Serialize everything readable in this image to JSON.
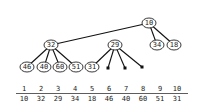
{
  "tree": {
    "nodes": [
      {
        "id": "n10",
        "label": "10",
        "x": 149,
        "y": 23
      },
      {
        "id": "n32",
        "label": "32",
        "x": 51,
        "y": 45
      },
      {
        "id": "n29",
        "label": "29",
        "x": 115,
        "y": 45
      },
      {
        "id": "n34",
        "label": "34",
        "x": 157,
        "y": 45
      },
      {
        "id": "n18",
        "label": "18",
        "x": 174,
        "y": 45
      },
      {
        "id": "n46",
        "label": "46",
        "x": 27,
        "y": 67
      },
      {
        "id": "n40",
        "label": "40",
        "x": 44,
        "y": 67
      },
      {
        "id": "n60",
        "label": "60",
        "x": 60,
        "y": 67
      },
      {
        "id": "n51",
        "label": "51",
        "x": 76,
        "y": 67
      },
      {
        "id": "n31",
        "label": "31",
        "x": 92,
        "y": 67
      }
    ],
    "null_leaves": [
      {
        "x": 108,
        "y": 68
      },
      {
        "x": 125,
        "y": 68
      },
      {
        "x": 142,
        "y": 67
      }
    ],
    "edges": [
      [
        "n10",
        "n32"
      ],
      [
        "n10",
        "n34"
      ],
      [
        "n10",
        "n18"
      ],
      [
        "n32",
        "n46"
      ],
      [
        "n32",
        "n40"
      ],
      [
        "n32",
        "n60"
      ],
      [
        "n32",
        "n51"
      ],
      [
        "n29",
        "n31"
      ]
    ],
    "null_edges_from": "n29"
  },
  "array_table": {
    "indices": [
      "1",
      "2",
      "3",
      "4",
      "5",
      "6",
      "7",
      "8",
      "9",
      "10"
    ],
    "values": [
      "10",
      "32",
      "29",
      "34",
      "18",
      "46",
      "40",
      "60",
      "51",
      "31"
    ]
  }
}
